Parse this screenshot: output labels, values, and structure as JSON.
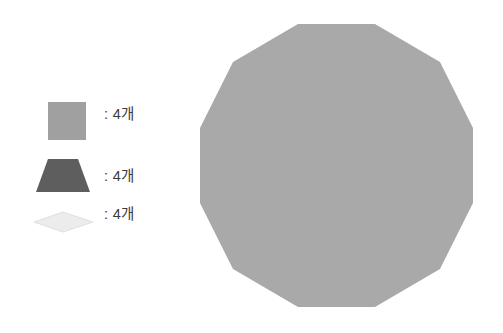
{
  "canvas": {
    "width": 503,
    "height": 333,
    "background": "#ffffff"
  },
  "colors": {
    "square_fill": "#a0a0a0",
    "trapezoid_fill": "#5e5e5e",
    "rhombus_fill": "#ececec",
    "rhombus_stroke": "#e0e0e0",
    "polygon_fill": "#a9a9a9",
    "text": "#3b3b3b"
  },
  "legend": {
    "items": [
      {
        "shape": "square",
        "shape_icon": "square-swatch-icon",
        "fill": "#a0a0a0",
        "label": ": 4개",
        "count": 4,
        "unit": "개"
      },
      {
        "shape": "trapezoid",
        "shape_icon": "trapezoid-swatch-icon",
        "fill": "#5e5e5e",
        "label": ": 4개",
        "count": 4,
        "unit": "개"
      },
      {
        "shape": "rhombus",
        "shape_icon": "rhombus-swatch-icon",
        "fill": "#ececec",
        "label": ": 4개",
        "count": 4,
        "unit": "개"
      }
    ]
  },
  "figure": {
    "name": "regular-dodecagon",
    "sides": 12,
    "fill": "#a9a9a9",
    "center_x": 340,
    "center_y": 165,
    "radius": 141,
    "points": "298,24 375,24 440,62 473,128 473,203 440,269 375,307 298,307 233,269 200,203 200,128 233,62"
  }
}
